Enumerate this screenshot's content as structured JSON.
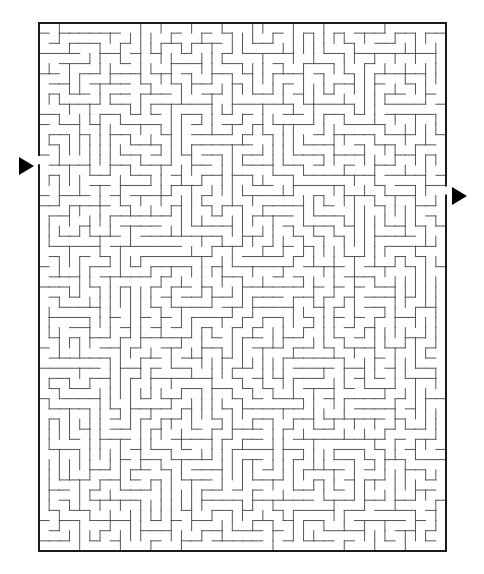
{
  "puzzle": {
    "type": "maze",
    "frame": {
      "x": 39,
      "y": 23,
      "width": 407,
      "height": 528,
      "border_color": "#1a1a1a",
      "border_width": 2
    },
    "grid": {
      "cols": 40,
      "rows": 52,
      "wall_color": "#555555",
      "wall_width": 1
    },
    "entrance": {
      "side": "left",
      "row": 13,
      "arrow_x": 19,
      "arrow_y": 157
    },
    "exit": {
      "side": "right",
      "row": 16,
      "arrow_x": 452,
      "arrow_y": 187
    }
  }
}
